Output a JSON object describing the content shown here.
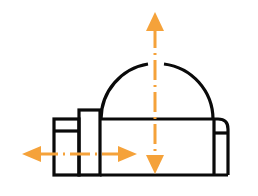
{
  "diagram": {
    "colors": {
      "outline": "#0a0a0a",
      "accent": "#f5a23a",
      "background": "#ffffff"
    },
    "icons": [
      "building-icon",
      "dome-icon",
      "vertical-arrow-icon",
      "horizontal-arrow-icon"
    ]
  }
}
